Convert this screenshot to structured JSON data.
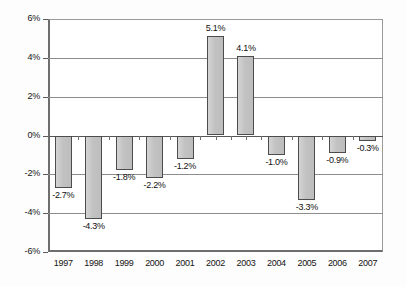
{
  "chart_data": {
    "type": "bar",
    "title": "",
    "subtitle": "",
    "xlabel": "",
    "ylabel": "",
    "categories": [
      "1997",
      "1998",
      "1999",
      "2000",
      "2001",
      "2002",
      "2003",
      "2004",
      "2005",
      "2006",
      "2007"
    ],
    "values": [
      -2.7,
      -4.3,
      -1.8,
      -2.2,
      -1.2,
      5.1,
      4.1,
      -1.0,
      -3.3,
      -0.9,
      -0.3
    ],
    "data_labels": [
      "-2.7%",
      "-4.3%",
      "-1.8%",
      "-2.2%",
      "-1.2%",
      "5.1%",
      "4.1%",
      "-1.0%",
      "-3.3%",
      "-0.9%",
      "-0.3%"
    ],
    "ylim": [
      -6,
      6
    ],
    "ytick_values": [
      6,
      4,
      2,
      0,
      -2,
      -4,
      -6
    ],
    "ytick_labels": [
      "6%",
      "4%",
      "2%",
      "0%",
      "-2%",
      "-4%",
      "-6%"
    ],
    "grid": true,
    "legend": "none",
    "legend_position": "none",
    "series": [
      {
        "name": "",
        "values": [
          -2.7,
          -4.3,
          -1.8,
          -2.2,
          -1.2,
          5.1,
          4.1,
          -1.0,
          -3.3,
          -0.9,
          -0.3
        ]
      }
    ],
    "colors": {
      "bar_fill": "#c6c6c6",
      "bar_border": "#4c4c4c",
      "gridline": "#8d8d8d",
      "axis": "#5b5b5b",
      "background": "#ffffff",
      "text": "#101010"
    }
  }
}
